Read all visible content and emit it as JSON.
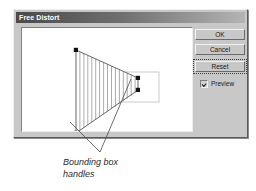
{
  "dialog": {
    "title": "Free Distort",
    "buttons": {
      "ok": "OK",
      "cancel": "Cancel",
      "reset": "Reset"
    },
    "preview": {
      "label": "Preview",
      "checked": true
    }
  },
  "caption": {
    "line1": "Bounding box",
    "line2": "handles"
  },
  "colors": {
    "dialog_face": "#c8c8c8",
    "titlebar_dark": "#4a4a4a",
    "titlebar_light": "#b4b4b4",
    "canvas": "#ffffff",
    "mesh_line": "#6e6e6e",
    "outline": "#3c3c3c",
    "bbox": "#b0b0b0",
    "handle": "#111111",
    "caption_text": "#2b2b2b"
  },
  "canvas": {
    "bounding_box": {
      "x": 61,
      "y": 44,
      "width": 76,
      "height": 30
    },
    "distort_shape": {
      "points": [
        [
          54,
          22
        ],
        [
          116,
          50
        ],
        [
          116,
          62
        ],
        [
          54,
          105
        ]
      ],
      "handles": [
        {
          "name": "top-left-handle",
          "x": 54,
          "y": 22
        },
        {
          "name": "top-right-handle",
          "x": 116,
          "y": 50
        },
        {
          "name": "bottom-right-handle",
          "x": 116,
          "y": 62
        },
        {
          "name": "bottom-left-handle",
          "x": 54,
          "y": 105
        }
      ],
      "mesh_line_count": 15
    }
  },
  "callout": {
    "apex": {
      "x": 100,
      "y": 152
    },
    "targets": [
      {
        "x": 70,
        "y": 122
      },
      {
        "x": 131,
        "y": 79
      }
    ]
  }
}
